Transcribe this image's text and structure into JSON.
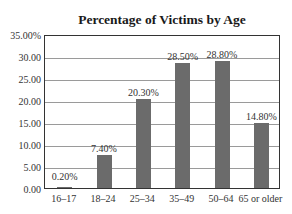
{
  "chart_data": {
    "type": "bar",
    "title": "Percentage of Victims by Age",
    "xlabel": "",
    "ylabel": "",
    "categories": [
      "16–17",
      "18–24",
      "25–34",
      "35–49",
      "50–64",
      "65 or older"
    ],
    "values": [
      0.2,
      7.4,
      20.3,
      28.5,
      28.8,
      14.8
    ],
    "value_labels": [
      "0.20%",
      "7.40%",
      "20.30%",
      "28.50%",
      "28.80%",
      "14.80%"
    ],
    "yticks": [
      0,
      5,
      10,
      15,
      20,
      25,
      30,
      35
    ],
    "ytick_labels": [
      "0.00",
      "5.00",
      "10.00",
      "15.00",
      "20.00",
      "25.00",
      "30.00",
      "35.00%"
    ],
    "ylim": [
      0,
      35
    ],
    "grid": true,
    "legend": null,
    "bar_color": "#6b6b6b"
  }
}
